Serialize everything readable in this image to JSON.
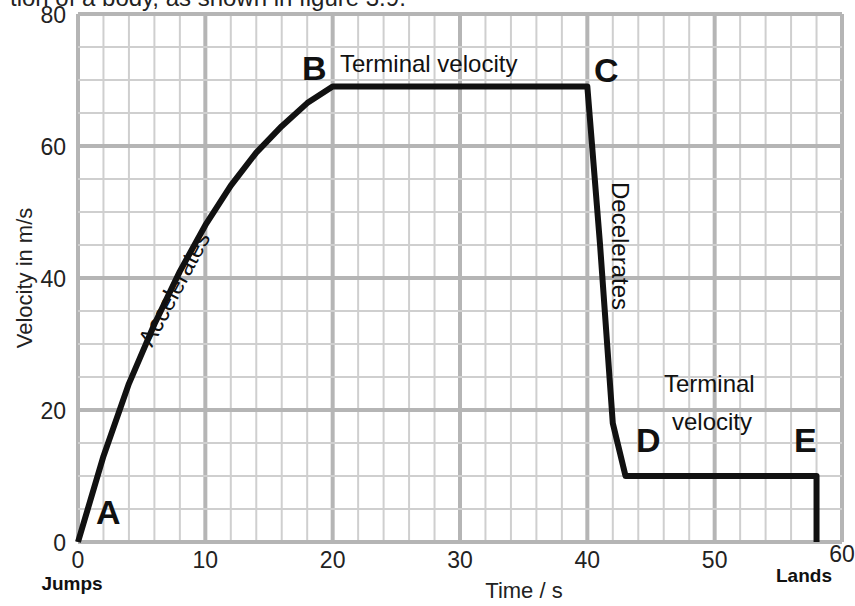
{
  "header": {
    "clipped_caption": "tion of a body, as shown in figure 3.9."
  },
  "chart_data": {
    "type": "line",
    "title": "",
    "xlabel": "Time / s",
    "ylabel": "Velocity in m/s",
    "xlim": [
      0,
      60
    ],
    "ylim": [
      0,
      80
    ],
    "x_ticks": [
      "0",
      "10",
      "20",
      "30",
      "40",
      "50",
      "60"
    ],
    "y_ticks": [
      "0",
      "20",
      "40",
      "60",
      "80"
    ],
    "grid": true,
    "series": [
      {
        "name": "Velocity of falling body",
        "x": [
          0,
          2,
          4,
          6,
          8,
          10,
          12,
          14,
          16,
          18,
          20,
          40,
          41,
          42,
          43,
          58,
          58
        ],
        "y": [
          0,
          13,
          24,
          33,
          41,
          48,
          54,
          59,
          63,
          66.5,
          69,
          69,
          45,
          18,
          10,
          10,
          0
        ]
      }
    ],
    "points": [
      {
        "label": "A",
        "x": 0,
        "y": 0
      },
      {
        "label": "B",
        "x": 20,
        "y": 69
      },
      {
        "label": "C",
        "x": 40,
        "y": 69
      },
      {
        "label": "D",
        "x": 43,
        "y": 10
      },
      {
        "label": "E",
        "x": 58,
        "y": 10
      }
    ],
    "annotations": [
      {
        "text": "Accelerates",
        "segment": "A-B"
      },
      {
        "text": "Terminal velocity",
        "segment": "B-C"
      },
      {
        "text": "Decelerates",
        "segment": "C-D"
      },
      {
        "text": "Terminal",
        "segment": "D-E"
      },
      {
        "text": "velocity",
        "segment": "D-E"
      },
      {
        "text": "Jumps",
        "at_x": 0
      },
      {
        "text": "Lands",
        "at_x": 58
      }
    ]
  }
}
